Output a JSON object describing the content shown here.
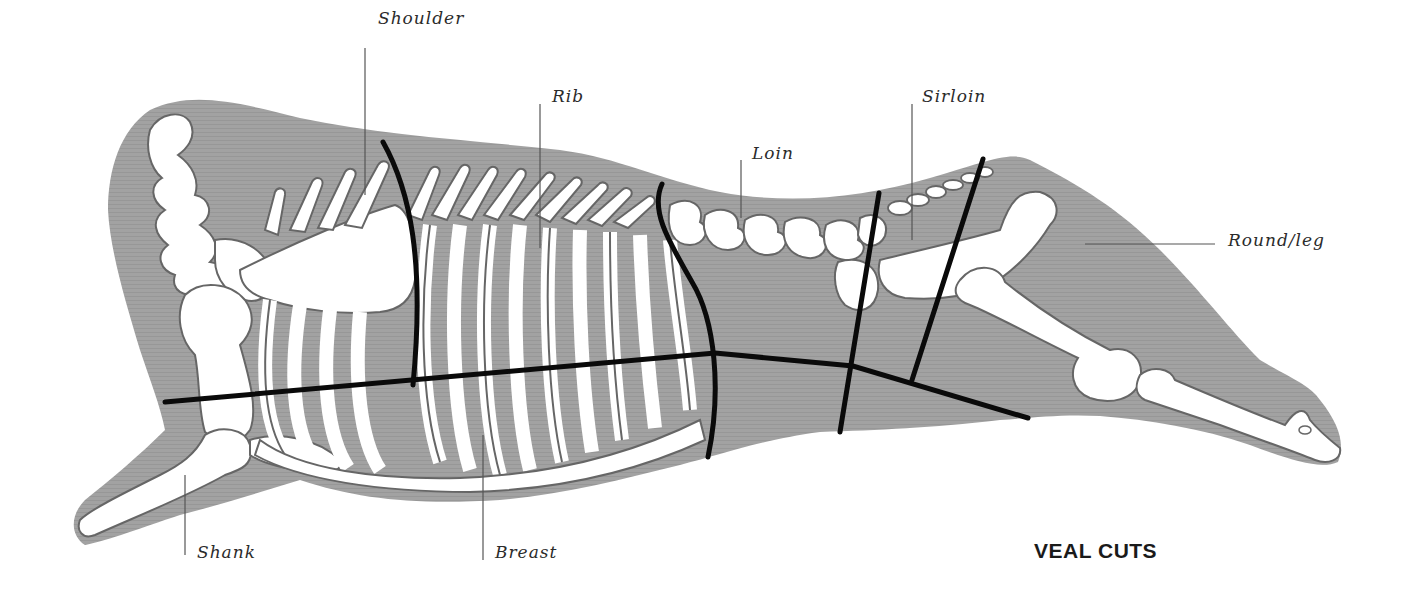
{
  "title": "VEAL CUTS",
  "colors": {
    "body": "#9e9e9e",
    "bone": "#ffffff",
    "bone_outline": "#666666",
    "cut_line": "#0a0a0a",
    "leader_line": "#555555",
    "label_text": "#2b2b2b"
  },
  "cuts": [
    {
      "id": "shoulder",
      "label": "Shoulder"
    },
    {
      "id": "rib",
      "label": "Rib"
    },
    {
      "id": "loin",
      "label": "Loin"
    },
    {
      "id": "sirloin",
      "label": "Sirloin"
    },
    {
      "id": "round_leg",
      "label": "Round/leg"
    },
    {
      "id": "shank",
      "label": "Shank"
    },
    {
      "id": "breast",
      "label": "Breast"
    }
  ]
}
